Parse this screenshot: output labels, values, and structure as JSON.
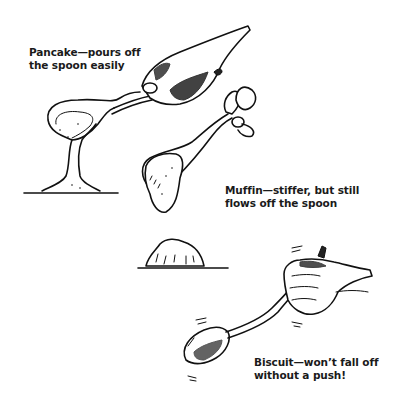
{
  "figure": {
    "panels": [
      {
        "id": "pancake",
        "label_line1": "Pancake—pours off",
        "label_line2": "the spoon easily"
      },
      {
        "id": "muffin",
        "label_line1": "Muffin—stiffer, but still",
        "label_line2": "flows off the spoon"
      },
      {
        "id": "biscuit",
        "label_line1": "Biscuit—won’t fall off",
        "label_line2": "without a push!"
      }
    ],
    "icons": {
      "pancake_drawing": "hand-pouring-spoon-icon",
      "muffin_drawing": "hand-dropping-spoon-icon",
      "biscuit_drawing": "hand-shaking-spoon-icon"
    }
  }
}
